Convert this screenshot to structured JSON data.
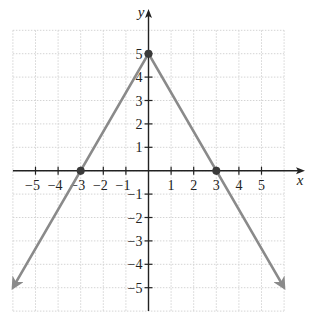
{
  "chart_data": {
    "type": "line",
    "title": "",
    "xlabel": "x",
    "ylabel": "y",
    "xlim": [
      -6,
      6
    ],
    "ylim": [
      -6,
      6
    ],
    "grid": true,
    "xticks": [
      -5,
      -4,
      -3,
      -2,
      -1,
      1,
      2,
      3,
      4,
      5
    ],
    "yticks": [
      -5,
      -4,
      -3,
      -2,
      -1,
      1,
      2,
      3,
      4,
      5
    ],
    "xtick_labels": [
      "−5",
      "−4",
      "−3",
      "−2",
      "−1",
      "1",
      "2",
      "3",
      "4",
      "5"
    ],
    "ytick_labels": [
      "−5",
      "−4",
      "−3",
      "−2",
      "−1",
      "1",
      "2",
      "3",
      "4",
      "5"
    ],
    "series": [
      {
        "x": [
          -6,
          0,
          6
        ],
        "y": [
          -5,
          5,
          -5
        ],
        "arrows_at_ends": true
      }
    ],
    "marked_points": [
      {
        "x": 0,
        "y": 5
      },
      {
        "x": -3,
        "y": 0
      },
      {
        "x": 3,
        "y": 0
      }
    ],
    "legend": null
  },
  "style": {
    "line_color": "#8a8a8a",
    "axis_color": "#222222",
    "point_color": "#3a3a3a",
    "grid_color": "#d4d4d4"
  }
}
